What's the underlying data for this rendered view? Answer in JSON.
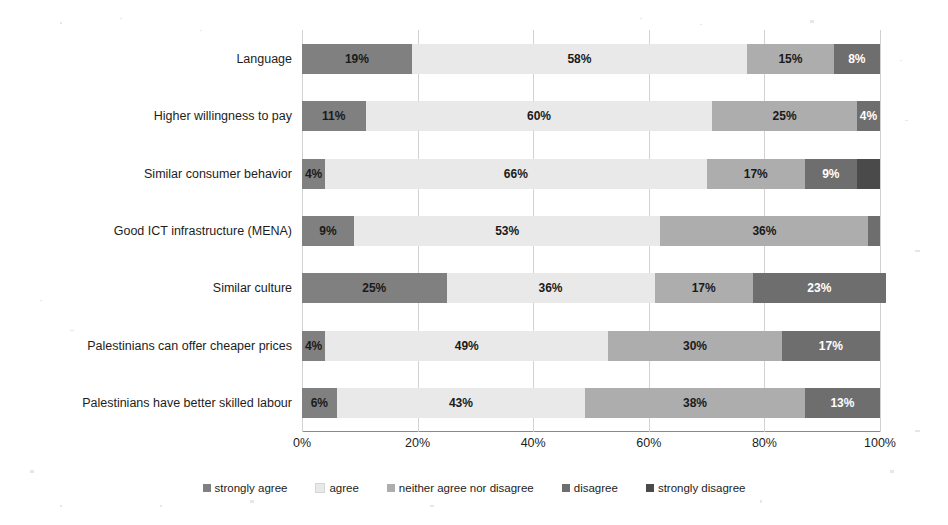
{
  "chart_data": {
    "type": "bar",
    "orientation": "horizontal",
    "stacked": true,
    "title": "",
    "xlabel": "",
    "ylabel": "",
    "xlim": [
      0,
      100
    ],
    "xticks": [
      "0%",
      "20%",
      "40%",
      "60%",
      "80%",
      "100%"
    ],
    "xtick_values": [
      0,
      20,
      40,
      60,
      80,
      100
    ],
    "grid": true,
    "legend_position": "bottom",
    "categories": [
      "Language",
      "Higher willingness to pay",
      "Similar consumer behavior",
      "Good ICT infrastructure (MENA)",
      "Similar culture",
      "Palestinians can offer cheaper prices",
      "Palestinians have better skilled labour"
    ],
    "series": [
      {
        "name": "strongly agree",
        "color": "#808080",
        "text_color": "#1a1a1a",
        "values": [
          19,
          11,
          4,
          9,
          25,
          4,
          6
        ],
        "labels": [
          "19%",
          "11%",
          "4%",
          "9%",
          "25%",
          "4%",
          "6%"
        ]
      },
      {
        "name": "agree",
        "color": "#e9e9e9",
        "text_color": "#1a1a1a",
        "values": [
          58,
          60,
          66,
          53,
          36,
          49,
          43
        ],
        "labels": [
          "58%",
          "60%",
          "66%",
          "53%",
          "36%",
          "49%",
          "43%"
        ]
      },
      {
        "name": "neither agree nor disagree",
        "color": "#adadad",
        "text_color": "#1a1a1a",
        "values": [
          15,
          25,
          17,
          36,
          17,
          30,
          38
        ],
        "labels": [
          "15%",
          "25%",
          "17%",
          "36%",
          "17%",
          "30%",
          "38%"
        ]
      },
      {
        "name": "disagree",
        "color": "#6e6e6e",
        "text_color": "#ffffff",
        "values": [
          8,
          4,
          9,
          2,
          23,
          17,
          13
        ],
        "labels": [
          "8%",
          "4%",
          "9%",
          "",
          "23%",
          "17%",
          "13%"
        ]
      },
      {
        "name": "strongly disagree",
        "color": "#4a4a4a",
        "text_color": "#ffffff",
        "values": [
          0,
          0,
          4,
          0,
          0,
          0,
          0
        ],
        "labels": [
          "",
          "",
          "",
          "",
          "",
          "",
          ""
        ]
      }
    ]
  }
}
